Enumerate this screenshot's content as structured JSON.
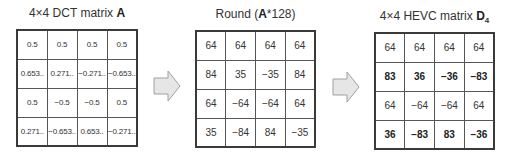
{
  "matrices": [
    {
      "title_prefix": "4×4 DCT matrix ",
      "title_bold": "A",
      "title_suffix": "",
      "title_sub": "",
      "rows": [
        [
          "0.5",
          "0.5",
          "0.5",
          "0.5"
        ],
        [
          "0.653..",
          "0.271..",
          "−0.271..",
          "−0.653.."
        ],
        [
          "0.5",
          "−0.5",
          "−0.5",
          "0.5"
        ],
        [
          "0.271..",
          "−0.653..",
          "0.653..",
          "−0.271.."
        ]
      ]
    },
    {
      "title_prefix": "Round (",
      "title_bold": "A",
      "title_suffix": "*128)",
      "title_sub": "",
      "rows": [
        [
          "64",
          "64",
          "64",
          "64"
        ],
        [
          "84",
          "35",
          "−35",
          "84"
        ],
        [
          "64",
          "−64",
          "−64",
          "64"
        ],
        [
          "35",
          "−84",
          "84",
          "−35"
        ]
      ]
    },
    {
      "title_prefix": "4×4 HEVC matrix ",
      "title_bold": "D",
      "title_suffix": "",
      "title_sub": "4",
      "rows": [
        [
          "64",
          "64",
          "64",
          "64"
        ],
        [
          "83",
          "36",
          "−36",
          "−83"
        ],
        [
          "64",
          "−64",
          "−64",
          "64"
        ],
        [
          "36",
          "−83",
          "83",
          "−36"
        ]
      ],
      "bold_rows": [
        1,
        3
      ]
    }
  ],
  "arrows": [
    {
      "icon": "right-arrow-icon"
    },
    {
      "icon": "right-arrow-icon"
    }
  ],
  "colors": {
    "arrow_fill": "#e6e6e6",
    "arrow_stroke": "#a0a0a0",
    "grid": "#555555",
    "border": "#3a3a3a"
  }
}
